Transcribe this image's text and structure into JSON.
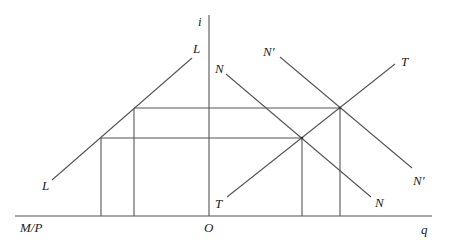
{
  "diagram": {
    "axes": {
      "vertical_label": "i",
      "horizontal_left_label": "M/P",
      "horizontal_right_label": "q",
      "origin_label": "O"
    },
    "curves": [
      {
        "name": "L",
        "label_start": "L",
        "label_end": "L"
      },
      {
        "name": "N",
        "label_start": "N",
        "label_end": "N"
      },
      {
        "name": "N'",
        "label_start": "N'",
        "label_end": "N'"
      },
      {
        "name": "T",
        "label_start": "T",
        "label_end": "T"
      }
    ],
    "geometry": {
      "origin": [
        209,
        216
      ],
      "vertical_axis_top": [
        209,
        15
      ],
      "horizontal_axis": [
        [
          15,
          216
        ],
        [
          432,
          216
        ]
      ],
      "L_line": [
        [
          52,
          180
        ],
        [
          192,
          58
        ]
      ],
      "N_line": [
        [
          226,
          74
        ],
        [
          371,
          197
        ]
      ],
      "Nprime_line": [
        [
          280,
          57
        ],
        [
          412,
          168
        ]
      ],
      "T_line": [
        [
          227,
          197
        ],
        [
          395,
          64
        ]
      ],
      "upper_equilibrium": [
        340,
        108
      ],
      "lower_equilibrium": [
        302,
        138
      ],
      "upper_L_point": [
        134,
        108
      ],
      "lower_L_point": [
        101,
        138
      ]
    }
  }
}
